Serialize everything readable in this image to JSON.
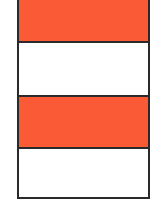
{
  "diagram": {
    "type": "striped-column",
    "colors": {
      "filled": "#FA5A35",
      "empty": "#FFFFFF",
      "border": "#2A2A2A"
    },
    "bands": [
      {
        "state": "filled",
        "fill": "#FA5A35"
      },
      {
        "state": "empty",
        "fill": "#FFFFFF"
      },
      {
        "state": "filled",
        "fill": "#FA5A35"
      },
      {
        "state": "empty",
        "fill": "#FFFFFF"
      }
    ]
  }
}
